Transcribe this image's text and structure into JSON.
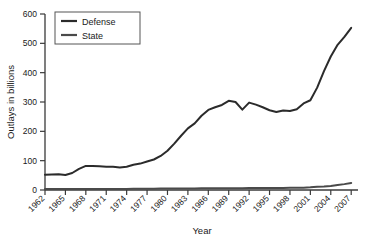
{
  "chart_data": {
    "type": "line",
    "title": "",
    "xlabel": "Year",
    "ylabel": "Outlays in billions",
    "xlim": [
      1962,
      2008
    ],
    "ylim": [
      0,
      600
    ],
    "grid": false,
    "legend_position": "top-left",
    "xticks": [
      "1962",
      "1965",
      "1968",
      "1971",
      "1974",
      "1977",
      "1980",
      "1983",
      "1986",
      "1989",
      "1992",
      "1995",
      "1998",
      "2001",
      "2004",
      "2007"
    ],
    "yticks": [
      "0",
      "100",
      "200",
      "300",
      "400",
      "500",
      "600"
    ],
    "x": [
      1962,
      1963,
      1964,
      1965,
      1966,
      1967,
      1968,
      1969,
      1970,
      1971,
      1972,
      1973,
      1974,
      1975,
      1976,
      1977,
      1978,
      1979,
      1980,
      1981,
      1982,
      1983,
      1984,
      1985,
      1986,
      1987,
      1988,
      1989,
      1990,
      1991,
      1992,
      1993,
      1994,
      1995,
      1996,
      1997,
      1998,
      1999,
      2000,
      2001,
      2002,
      2003,
      2004,
      2005,
      2006,
      2007
    ],
    "series": [
      {
        "name": "Defense",
        "color": "#2b2b2b",
        "values": [
          52,
          53,
          54,
          51,
          58,
          72,
          82,
          82,
          81,
          79,
          79,
          77,
          79,
          86,
          90,
          97,
          104,
          116,
          134,
          158,
          185,
          210,
          227,
          253,
          273,
          282,
          290,
          304,
          300,
          274,
          298,
          291,
          282,
          272,
          266,
          271,
          269,
          275,
          295,
          306,
          349,
          405,
          455,
          495,
          522,
          553
        ]
      },
      {
        "name": "State",
        "color": "#4a4a4a",
        "values": [
          3,
          3,
          3,
          3,
          3,
          3,
          3,
          3,
          3,
          3,
          3,
          3,
          3,
          4,
          4,
          4,
          4,
          5,
          5,
          5,
          5,
          5,
          5,
          6,
          6,
          6,
          6,
          6,
          6,
          6,
          7,
          7,
          7,
          7,
          7,
          7,
          8,
          8,
          8,
          9,
          11,
          12,
          14,
          17,
          20,
          24
        ]
      }
    ]
  },
  "legend": {
    "items": [
      {
        "label": "Defense"
      },
      {
        "label": "State"
      }
    ]
  },
  "axes": {
    "y_title": "Outlays in billions",
    "x_title": "Year"
  }
}
